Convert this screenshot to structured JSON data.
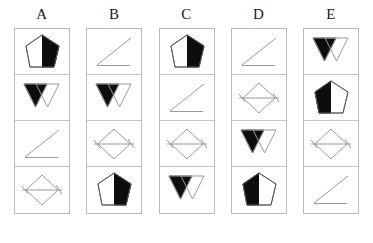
{
  "figure": {
    "type": "shape-sequence-grid",
    "columns_count": 5,
    "rows_count": 4,
    "background_color": "#ffffff",
    "outline_color": "#9a9a9a",
    "fill_color": "#0d0d0d",
    "shape_names": [
      "pentagon-half-black",
      "double-triangle-left-black",
      "diagonal-line",
      "diamond-with-line"
    ]
  },
  "columns": [
    {
      "label": "A",
      "cells": [
        {
          "shape": "pentagon-half-black",
          "fill_side": "right"
        },
        {
          "shape": "double-triangle-left-black",
          "fill_side": "left"
        },
        {
          "shape": "diagonal-line",
          "fill_side": "none"
        },
        {
          "shape": "diamond-with-line",
          "fill_side": "none"
        }
      ]
    },
    {
      "label": "B",
      "cells": [
        {
          "shape": "diagonal-line",
          "fill_side": "none"
        },
        {
          "shape": "double-triangle-left-black",
          "fill_side": "left"
        },
        {
          "shape": "diamond-with-line",
          "fill_side": "none"
        },
        {
          "shape": "pentagon-half-black",
          "fill_side": "right"
        }
      ]
    },
    {
      "label": "C",
      "cells": [
        {
          "shape": "pentagon-half-black",
          "fill_side": "right"
        },
        {
          "shape": "diagonal-line",
          "fill_side": "none"
        },
        {
          "shape": "diamond-with-line",
          "fill_side": "none"
        },
        {
          "shape": "double-triangle-left-black",
          "fill_side": "left"
        }
      ]
    },
    {
      "label": "D",
      "cells": [
        {
          "shape": "diagonal-line",
          "fill_side": "none"
        },
        {
          "shape": "diamond-with-line",
          "fill_side": "none"
        },
        {
          "shape": "double-triangle-left-black",
          "fill_side": "left"
        },
        {
          "shape": "pentagon-half-black",
          "fill_side": "left"
        }
      ]
    },
    {
      "label": "E",
      "cells": [
        {
          "shape": "double-triangle-left-black",
          "fill_side": "left"
        },
        {
          "shape": "pentagon-half-black",
          "fill_side": "left"
        },
        {
          "shape": "diamond-with-line",
          "fill_side": "none"
        },
        {
          "shape": "diagonal-line",
          "fill_side": "none"
        }
      ]
    }
  ]
}
